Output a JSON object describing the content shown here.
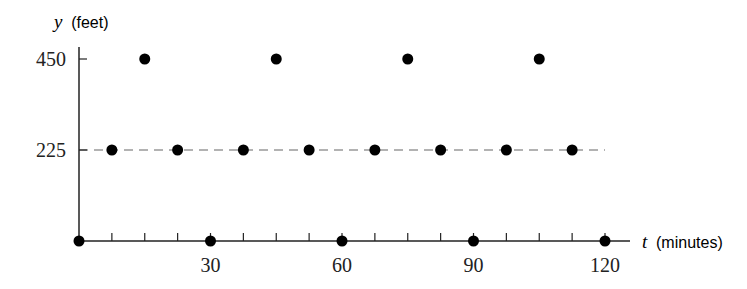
{
  "chart_data": {
    "type": "scatter",
    "title": "",
    "xlabel": "t (minutes)",
    "xlabel_var": "t",
    "xlabel_unit": "(minutes)",
    "ylabel": "y (feet)",
    "ylabel_var": "y",
    "ylabel_unit": "(feet)",
    "xlim": [
      0,
      120
    ],
    "ylim": [
      0,
      450
    ],
    "x_ticks": [
      0,
      7.5,
      15,
      22.5,
      30,
      37.5,
      45,
      52.5,
      60,
      67.5,
      75,
      82.5,
      90,
      97.5,
      105,
      112.5,
      120
    ],
    "x_tick_labels": [
      {
        "value": 30,
        "label": "30"
      },
      {
        "value": 60,
        "label": "60"
      },
      {
        "value": 90,
        "label": "90"
      },
      {
        "value": 120,
        "label": "120"
      }
    ],
    "y_tick_labels": [
      {
        "value": 225,
        "label": "225"
      },
      {
        "value": 450,
        "label": "450"
      }
    ],
    "reference_line": {
      "y": 225,
      "style": "dashed",
      "x_from": 0,
      "x_to": 120
    },
    "grid": false,
    "legend": null,
    "points": [
      {
        "t": 0,
        "y": 0
      },
      {
        "t": 7.5,
        "y": 225
      },
      {
        "t": 15,
        "y": 450
      },
      {
        "t": 22.5,
        "y": 225
      },
      {
        "t": 30,
        "y": 0
      },
      {
        "t": 37.5,
        "y": 225
      },
      {
        "t": 45,
        "y": 450
      },
      {
        "t": 52.5,
        "y": 225
      },
      {
        "t": 60,
        "y": 0
      },
      {
        "t": 67.5,
        "y": 225
      },
      {
        "t": 75,
        "y": 450
      },
      {
        "t": 82.5,
        "y": 225
      },
      {
        "t": 90,
        "y": 0
      },
      {
        "t": 97.5,
        "y": 225
      },
      {
        "t": 105,
        "y": 450
      },
      {
        "t": 112.5,
        "y": 225
      },
      {
        "t": 120,
        "y": 0
      }
    ],
    "colors": {
      "points": "#000000",
      "axis": "#222222",
      "dashed": "#999999"
    }
  }
}
